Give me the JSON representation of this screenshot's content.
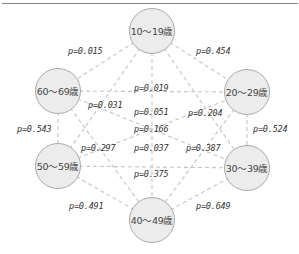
{
  "nodes": [
    {
      "id": "n10",
      "label": "10〜19歳",
      "x": 152,
      "y": 31
    },
    {
      "id": "n20",
      "label": "20〜29歳",
      "x": 247,
      "y": 92
    },
    {
      "id": "n30",
      "label": "30〜39歳",
      "x": 247,
      "y": 168
    },
    {
      "id": "n40",
      "label": "40〜49歳",
      "x": 152,
      "y": 220
    },
    {
      "id": "n50",
      "label": "50〜59歳",
      "x": 58,
      "y": 166
    },
    {
      "id": "n60",
      "label": "60〜69歳",
      "x": 58,
      "y": 91
    }
  ],
  "edges": [
    {
      "from": "10〜19歳",
      "to": "60〜69歳",
      "label": "p=0.015"
    },
    {
      "from": "10〜19歳",
      "to": "20〜29歳",
      "label": "p=0.454"
    },
    {
      "from": "60〜69歳",
      "to": "20〜29歳",
      "label": "p=0.019"
    },
    {
      "from": "10〜19歳",
      "to": "50〜59歳",
      "label": "p=0.031"
    },
    {
      "from": "10〜19歳",
      "to": "40〜49歳",
      "label": "p=0.051"
    },
    {
      "from": "50〜59歳",
      "to": "20〜29歳",
      "label": "p=0.204"
    },
    {
      "from": "60〜69歳",
      "to": "30〜39歳",
      "label": "p=0.166"
    },
    {
      "from": "20〜29歳",
      "to": "40〜49歳",
      "label": "p=0.297"
    },
    {
      "from": "10〜19歳",
      "to": "30〜39歳",
      "label": "p=0.387"
    },
    {
      "from": "50〜59歳",
      "to": "30〜39歳",
      "label": "p=0.037"
    },
    {
      "from": "60〜69歳",
      "to": "40〜49歳",
      "label": "p=0.375"
    },
    {
      "from": "60〜69歳",
      "to": "50〜59歳",
      "label": "p=0.543"
    },
    {
      "from": "20〜29歳",
      "to": "30〜39歳",
      "label": "p=0.524"
    },
    {
      "from": "50〜59歳",
      "to": "40〜49歳",
      "label": "p=0.491"
    },
    {
      "from": "40〜49歳",
      "to": "30〜39歳",
      "label": "p=0.649"
    }
  ],
  "labels": {
    "p_015": "p=0.015",
    "p_454": "p=0.454",
    "p_019": "p=0.019",
    "p_031": "p=0.031",
    "p_051": "p=0.051",
    "p_204": "p=0.204",
    "p_166": "p=0.166",
    "p_297": "p=0.297",
    "p_037": "p=0.037",
    "p_387": "p=0.387",
    "p_375": "p=0.375",
    "p_543": "p=0.543",
    "p_524": "p=0.524",
    "p_491": "p=0.491",
    "p_649": "p=0.649"
  },
  "node_labels": {
    "n10": "10〜19歳",
    "n20": "20〜29歳",
    "n30": "30〜39歳",
    "n40": "40〜49歳",
    "n50": "50〜59歳",
    "n60": "60〜69歳"
  },
  "colors": {
    "node_fill": "#ececec",
    "node_border": "#a9a9a9",
    "edge": "#c4c4c4",
    "text": "#333333"
  }
}
